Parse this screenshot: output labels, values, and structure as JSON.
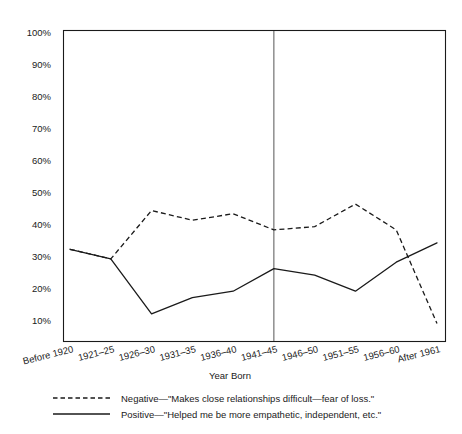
{
  "chart_data": {
    "type": "line",
    "title": "",
    "xlabel": "Year Born",
    "ylabel": "",
    "categories": [
      "Before 1920",
      "1921–25",
      "1926–30",
      "1931–35",
      "1936–40",
      "1941–45",
      "1946–50",
      "1951–55",
      "1956–60",
      "After 1961"
    ],
    "series": [
      {
        "name": "Negative—\"Makes close relationships difficult—fear of loss.\"",
        "style": "dashed",
        "values": [
          33,
          30,
          45,
          42,
          44,
          39,
          40,
          47,
          39,
          10
        ]
      },
      {
        "name": "Positive—\"Helped me be more empathetic, independent, etc.\"",
        "style": "solid",
        "values": [
          33,
          30,
          13,
          18,
          20,
          27,
          25,
          20,
          29,
          35
        ]
      }
    ],
    "ylim": [
      0,
      100
    ],
    "yticks": [
      10,
      20,
      30,
      40,
      50,
      60,
      70,
      80,
      90,
      100
    ],
    "ytick_labels": [
      "10%",
      "20%",
      "30%",
      "40%",
      "50%",
      "60%",
      "70%",
      "80%",
      "90%",
      "100%"
    ],
    "grid": false,
    "legend_position": "bottom-left",
    "annotations": [
      {
        "type": "vertical-divider",
        "at_category": "1941–45",
        "description": "vertical reference line between 1941–45 and 1946–50"
      }
    ]
  },
  "legend": {
    "items": [
      {
        "style": "dashed",
        "label": "Negative—\"Makes close relationships difficult—fear of loss.\""
      },
      {
        "style": "solid",
        "label": "Positive—\"Helped me be more empathetic, independent, etc.\""
      }
    ]
  },
  "colors": {
    "ink": "#1a1a1a",
    "divider": "#555555",
    "background": "#ffffff"
  }
}
